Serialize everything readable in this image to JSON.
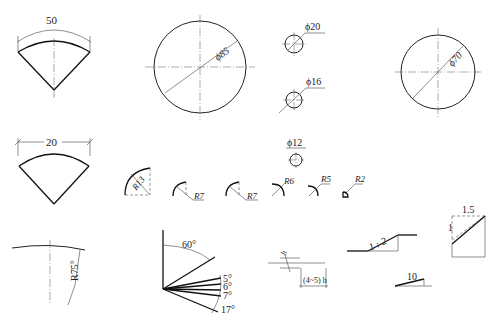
{
  "figures": {
    "sector_arc": {
      "label": "50"
    },
    "circle_85": {
      "label": "ϕ85"
    },
    "circle_20": {
      "label": "ϕ20"
    },
    "circle_16": {
      "label": "ϕ16"
    },
    "circle_70": {
      "label": "ϕ70"
    },
    "sector_chord": {
      "label": "20"
    },
    "circle_12": {
      "label": "ϕ12"
    },
    "radii": [
      {
        "label": "R13"
      },
      {
        "label": "R7"
      },
      {
        "label": "R7"
      },
      {
        "label": "R6"
      },
      {
        "label": "R5"
      },
      {
        "label": "R2"
      }
    ],
    "large_radius": {
      "label": "R75°"
    },
    "angles": {
      "a60": "60°",
      "a5": "5°",
      "a6": "6°",
      "a7": "7°",
      "a17": "17°"
    },
    "spacing": {
      "top": "h",
      "box": "(4~5) h"
    },
    "slope": {
      "label": "1 : 2"
    },
    "taper": {
      "label": "10"
    },
    "slope_box": {
      "top": "1.5",
      "side": "1"
    }
  }
}
